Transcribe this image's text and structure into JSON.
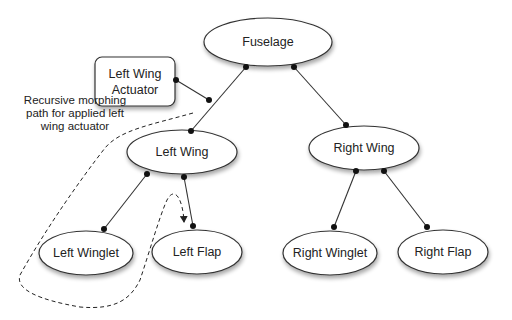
{
  "diagram": {
    "type": "tree",
    "nodes": [
      {
        "id": "fuselage",
        "label": "Fuselage",
        "shape": "ellipse"
      },
      {
        "id": "left_wing",
        "label": "Left Wing",
        "shape": "ellipse"
      },
      {
        "id": "right_wing",
        "label": "Right Wing",
        "shape": "ellipse"
      },
      {
        "id": "left_winglet",
        "label": "Left Winglet",
        "shape": "ellipse"
      },
      {
        "id": "left_flap",
        "label": "Left Flap",
        "shape": "ellipse"
      },
      {
        "id": "right_winglet",
        "label": "Right Winglet",
        "shape": "ellipse"
      },
      {
        "id": "right_flap",
        "label": "Right Flap",
        "shape": "ellipse"
      },
      {
        "id": "actuator",
        "label_line1": "Left Wing",
        "label_line2": "Actuator",
        "shape": "rounded-rect"
      }
    ],
    "edges": [
      {
        "from": "fuselage",
        "to": "left_wing"
      },
      {
        "from": "fuselage",
        "to": "right_wing"
      },
      {
        "from": "left_wing",
        "to": "left_winglet"
      },
      {
        "from": "left_wing",
        "to": "left_flap"
      },
      {
        "from": "right_wing",
        "to": "right_winglet"
      },
      {
        "from": "right_wing",
        "to": "right_flap"
      },
      {
        "from": "actuator",
        "to": "fuselage-left_wing-edge"
      }
    ],
    "annotation": {
      "line1": "Recursive morphing",
      "line2": "path for applied left",
      "line3": "wing actuator",
      "style": "dashed path with arrowhead ending at Left Flap"
    }
  },
  "colors": {
    "stroke": "#333333",
    "fill": "#ffffff",
    "text": "#222222"
  }
}
